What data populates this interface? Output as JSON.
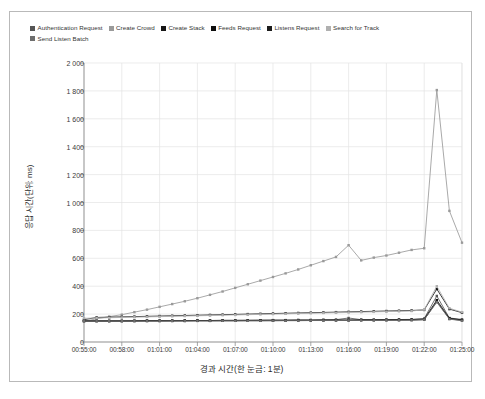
{
  "chart_data": {
    "type": "line",
    "title": "",
    "xlabel": "경과 시간(한 눈금: 1분)",
    "ylabel": "응답 시간(단위: ms)",
    "ylim": [
      0,
      2000
    ],
    "ytick_labels": [
      "2 000",
      "1 800",
      "1 600",
      "1 400",
      "1 200",
      "1 000",
      "800",
      "600",
      "400",
      "200",
      "0"
    ],
    "ytick_values": [
      2000,
      1800,
      1600,
      1400,
      1200,
      1000,
      800,
      600,
      400,
      200,
      0
    ],
    "grid": true,
    "legend_position": "top-left",
    "x": [
      "00:55:00",
      "00:56:00",
      "00:57:00",
      "00:58:00",
      "00:59:00",
      "01:00:00",
      "01:01:00",
      "01:02:00",
      "01:03:00",
      "01:04:00",
      "01:05:00",
      "01:06:00",
      "01:07:00",
      "01:08:00",
      "01:09:00",
      "01:10:00",
      "01:11:00",
      "01:12:00",
      "01:13:00",
      "01:14:00",
      "01:15:00",
      "01:16:00",
      "01:17:00",
      "01:18:00",
      "01:19:00",
      "01:20:00",
      "01:21:00",
      "01:22:00",
      "01:23:00",
      "01:24:00",
      "01:25:00"
    ],
    "xtick_labels": [
      "00:55:00",
      "00:58:00",
      "01:01:00",
      "01:04:00",
      "01:07:00",
      "01:10:00",
      "01:13:00",
      "01:16:00",
      "01:19:00",
      "01:22:00",
      "01:25:00"
    ],
    "series": [
      {
        "name": "Authentication Request",
        "color": "#555555",
        "values": [
          150,
          150,
          150,
          150,
          152,
          152,
          152,
          153,
          153,
          154,
          154,
          155,
          155,
          156,
          156,
          157,
          157,
          158,
          158,
          159,
          160,
          172,
          160,
          160,
          160,
          161,
          162,
          168,
          330,
          172,
          162
        ]
      },
      {
        "name": "Create Crowd",
        "color": "#9a9a9a",
        "values": [
          148,
          166,
          182,
          196,
          214,
          232,
          252,
          272,
          292,
          314,
          338,
          362,
          388,
          414,
          440,
          466,
          492,
          520,
          550,
          580,
          610,
          694,
          585,
          605,
          620,
          640,
          660,
          672,
          1806,
          940,
          712
        ]
      },
      {
        "name": "Create Stack",
        "color": "#161616",
        "values": [
          160,
          176,
          178,
          180,
          182,
          184,
          186,
          188,
          190,
          192,
          194,
          196,
          198,
          200,
          202,
          204,
          206,
          208,
          210,
          212,
          214,
          216,
          218,
          220,
          222,
          224,
          226,
          230,
          380,
          236,
          210
        ]
      },
      {
        "name": "Feeds Request",
        "color": "#0d0d0d",
        "values": [
          152,
          152,
          152,
          152,
          152,
          153,
          153,
          153,
          154,
          154,
          154,
          155,
          155,
          155,
          156,
          156,
          156,
          157,
          157,
          158,
          158,
          158,
          159,
          159,
          160,
          160,
          161,
          164,
          300,
          170,
          158
        ]
      },
      {
        "name": "Listens Request",
        "color": "#1c1c1c",
        "values": [
          150,
          150,
          150,
          150,
          150,
          151,
          151,
          151,
          151,
          152,
          152,
          152,
          152,
          153,
          153,
          153,
          154,
          154,
          154,
          155,
          155,
          155,
          156,
          156,
          156,
          157,
          157,
          160,
          290,
          166,
          155
        ]
      },
      {
        "name": "Search for Track",
        "color": "#b0b0b0",
        "values": [
          170,
          172,
          174,
          176,
          178,
          180,
          182,
          184,
          186,
          188,
          190,
          192,
          194,
          196,
          198,
          200,
          202,
          204,
          206,
          208,
          210,
          212,
          214,
          216,
          218,
          220,
          222,
          232,
          400,
          242,
          214
        ]
      },
      {
        "name": "Send Listen Batch",
        "color": "#6e6e6e",
        "values": [
          150,
          150,
          150,
          150,
          150,
          150,
          150,
          151,
          151,
          151,
          151,
          152,
          152,
          152,
          152,
          153,
          153,
          153,
          154,
          154,
          154,
          155,
          155,
          155,
          156,
          156,
          157,
          160,
          285,
          164,
          152
        ]
      }
    ]
  },
  "legend": {
    "items": [
      {
        "label": "Authentication Request",
        "color": "#555555"
      },
      {
        "label": "Create Crowd",
        "color": "#9a9a9a"
      },
      {
        "label": "Create Stack",
        "color": "#161616"
      },
      {
        "label": "Feeds Request",
        "color": "#0d0d0d"
      },
      {
        "label": "Listens Request",
        "color": "#1c1c1c"
      },
      {
        "label": "Search for Track",
        "color": "#b0b0b0"
      },
      {
        "label": "Send Listen Batch",
        "color": "#6e6e6e"
      }
    ]
  },
  "axes": {
    "y_title": "응답 시간(단위: ms)",
    "x_title": "경과 시간(한 눈금: 1분)"
  },
  "colors": {
    "card_border": "#b9b9b9",
    "grid": "#e4e4e4",
    "axis": "#8f8f8f",
    "text": "#2b2b2b"
  }
}
